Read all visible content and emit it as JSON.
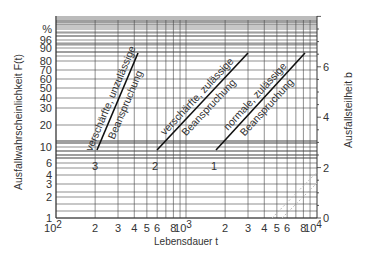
{
  "chart_data": {
    "type": "line",
    "title": "",
    "xlabel": "Lebensdauer t",
    "ylabel": "Ausfallwahrscheinlichkeit F(t)",
    "y2label": "Ausfallsteilheit b",
    "x_scale": "log",
    "xlim": [
      100,
      10000
    ],
    "x_ticks": [
      {
        "value": 100,
        "label": "10",
        "sup": "2"
      },
      {
        "value": 200,
        "label": "2"
      },
      {
        "value": 300,
        "label": "3"
      },
      {
        "value": 400,
        "label": "4"
      },
      {
        "value": 500,
        "label": "5"
      },
      {
        "value": 600,
        "label": "6"
      },
      {
        "value": 800,
        "label": "8"
      },
      {
        "value": 1000,
        "label": "10",
        "sup": "3"
      },
      {
        "value": 2000,
        "label": "2"
      },
      {
        "value": 3000,
        "label": "3"
      },
      {
        "value": 4000,
        "label": "4"
      },
      {
        "value": 5000,
        "label": "5"
      },
      {
        "value": 6000,
        "label": "6"
      },
      {
        "value": 8000,
        "label": "8"
      },
      {
        "value": 10000,
        "label": "10",
        "sup": "4"
      }
    ],
    "y_scale": "weibull",
    "y_unit": "%",
    "y_ticks": [
      {
        "value": 1,
        "label": "1",
        "py": 218
      },
      {
        "value": 2,
        "label": "2",
        "py": 197
      },
      {
        "value": 3,
        "label": "3",
        "py": 184
      },
      {
        "value": 4,
        "label": "4",
        "py": 175
      },
      {
        "value": 6,
        "label": "6",
        "py": 163
      },
      {
        "value": 10,
        "label": "10",
        "py": 147
      },
      {
        "value": 20,
        "label": "20",
        "py": 125
      },
      {
        "value": 30,
        "label": "30",
        "py": 108
      },
      {
        "value": 40,
        "label": "40",
        "py": 98
      },
      {
        "value": 50,
        "label": "50",
        "py": 88
      },
      {
        "value": 60,
        "label": "60",
        "py": 79
      },
      {
        "value": 70,
        "label": "70",
        "py": 70
      },
      {
        "value": 80,
        "label": "80",
        "py": 61
      },
      {
        "value": 90,
        "label": "90",
        "py": 48
      },
      {
        "value": 96,
        "label": "96",
        "py": 40
      },
      {
        "value": null,
        "label": "%",
        "py": 29
      }
    ],
    "y_extra_gridlines_py": [
      5,
      7,
      8,
      9,
      20,
      22,
      25,
      27,
      32,
      36,
      43,
      45,
      52,
      56,
      141,
      143,
      151,
      155,
      158
    ],
    "y2_ticks": [
      {
        "value": 0,
        "label": "0"
      },
      {
        "value": 2,
        "label": "2"
      },
      {
        "value": 4,
        "label": "4"
      },
      {
        "value": 6,
        "label": "6"
      }
    ],
    "y2lim": [
      0,
      8
    ],
    "grid": true,
    "series": [
      {
        "name": "3",
        "label_line1": "verschärfte, unzulässige",
        "label_line2": "Beanspruchung",
        "points": [
          [
            200,
            8
          ],
          [
            420,
            88
          ]
        ],
        "px": [
          [
            97,
            150
          ],
          [
            138,
            53
          ]
        ]
      },
      {
        "name": "2",
        "label_line1": "verschärfte, zulässige",
        "label_line2": "Beanspruchung",
        "points": [
          [
            600,
            8
          ],
          [
            3000,
            88
          ]
        ],
        "px": [
          [
            157,
            150
          ],
          [
            248,
            53
          ]
        ]
      },
      {
        "name": "1",
        "label_line1": "normale, zulässige",
        "label_line2": "Beanspruchung",
        "points": [
          [
            1700,
            8
          ],
          [
            8500,
            88
          ]
        ],
        "px": [
          [
            216,
            150
          ],
          [
            305,
            53
          ]
        ]
      }
    ],
    "faint_lines_px": [
      [
        [
          272,
          218
        ],
        [
          317,
          172
        ]
      ],
      [
        [
          282,
          218
        ],
        [
          317,
          183
        ]
      ]
    ]
  }
}
